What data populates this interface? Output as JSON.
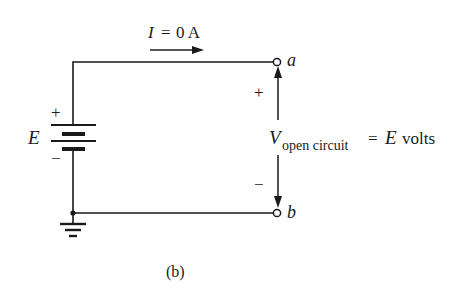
{
  "figure": {
    "caption": "(b)",
    "colors": {
      "stroke": "#1a1a1a",
      "background": "#ffffff"
    }
  },
  "current": {
    "symbol": "I",
    "equals": "=",
    "value": "0 A"
  },
  "source": {
    "label": "E",
    "plus": "+",
    "minus": "−"
  },
  "terminals": {
    "a": "a",
    "b": "b"
  },
  "voltage": {
    "plus": "+",
    "minus": "−",
    "symbol": "V",
    "subscript": "open circuit",
    "equation": "= E volts",
    "eq_sign": "=",
    "eq_symbol": "E",
    "eq_unit": "volts"
  }
}
